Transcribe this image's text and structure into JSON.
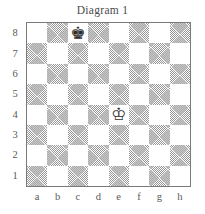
{
  "title": "Diagram 1",
  "board": {
    "orientation": "white-bottom",
    "files": [
      "a",
      "b",
      "c",
      "d",
      "e",
      "f",
      "g",
      "h"
    ],
    "ranks": [
      "8",
      "7",
      "6",
      "5",
      "4",
      "3",
      "2",
      "1"
    ],
    "light_square_color": "#ffffff",
    "dark_square_color": "#c9c9c9",
    "border_color": "#7a7a7a",
    "square_size_px": 20.375,
    "pieces": [
      {
        "piece": "black-king",
        "glyph": "♚",
        "color": "black",
        "square": "c8",
        "file_index": 2,
        "rank_index": 0
      },
      {
        "piece": "white-king",
        "glyph": "♔",
        "color": "white",
        "square": "e4",
        "file_index": 4,
        "rank_index": 4
      }
    ],
    "fen_position": "2k5/8/8/8/4K3/8/8/8"
  },
  "chart_data": {
    "type": "table",
    "title": "Diagram 1",
    "xlabel": "files",
    "ylabel": "ranks",
    "categories": [
      "a",
      "b",
      "c",
      "d",
      "e",
      "f",
      "g",
      "h"
    ],
    "rows": [
      "8",
      "7",
      "6",
      "5",
      "4",
      "3",
      "2",
      "1"
    ],
    "values": [
      [
        "",
        "",
        "♚",
        "",
        "",
        "",
        "",
        ""
      ],
      [
        "",
        "",
        "",
        "",
        "",
        "",
        "",
        ""
      ],
      [
        "",
        "",
        "",
        "",
        "",
        "",
        "",
        ""
      ],
      [
        "",
        "",
        "",
        "",
        "",
        "",
        "",
        ""
      ],
      [
        "",
        "",
        "",
        "",
        "♔",
        "",
        "",
        ""
      ],
      [
        "",
        "",
        "",
        "",
        "",
        "",
        "",
        ""
      ],
      [
        "",
        "",
        "",
        "",
        "",
        "",
        "",
        ""
      ],
      [
        "",
        "",
        "",
        "",
        "",
        "",
        "",
        ""
      ]
    ]
  }
}
